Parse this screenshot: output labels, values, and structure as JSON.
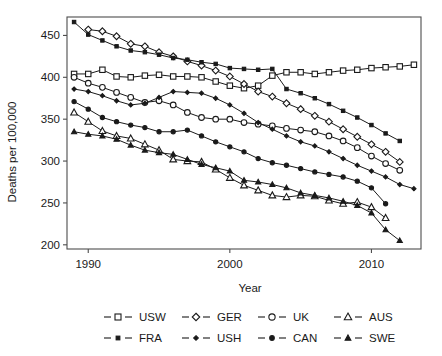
{
  "chart_data": {
    "type": "line",
    "title": "",
    "xlabel": "Year",
    "ylabel": "Deaths per 100,000",
    "xlim": [
      1988.5,
      2013.5
    ],
    "ylim": [
      195,
      472
    ],
    "xticks": [
      1990,
      2000,
      2010
    ],
    "yticks": [
      200,
      250,
      300,
      350,
      400,
      450
    ],
    "grid": false,
    "legend_position": "bottom",
    "legend_columns": 4,
    "series": [
      {
        "name": "USW",
        "label": "USW",
        "marker": "open-square",
        "color": "#1a1a1a",
        "fill": "#ffffff",
        "x": [
          1989,
          1990,
          1991,
          1992,
          1993,
          1994,
          1995,
          1996,
          1997,
          1998,
          1999,
          2000,
          2001,
          2002,
          2003,
          2004,
          2005,
          2006,
          2007,
          2008,
          2009,
          2010,
          2011,
          2012,
          2013
        ],
        "y": [
          404,
          404,
          409,
          401,
          400,
          402,
          403,
          401,
          401,
          400,
          395,
          390,
          387,
          390,
          402,
          406,
          406,
          404,
          406,
          408,
          409,
          411,
          412,
          413,
          415
        ]
      },
      {
        "name": "GER",
        "label": "GER",
        "marker": "open-diamond",
        "color": "#1a1a1a",
        "fill": "#ffffff",
        "x": [
          1990,
          1991,
          1992,
          1993,
          1994,
          1995,
          1996,
          1997,
          1998,
          1999,
          2000,
          2001,
          2002,
          2003,
          2004,
          2005,
          2006,
          2007,
          2008,
          2009,
          2010,
          2011,
          2012
        ],
        "y": [
          457,
          455,
          449,
          440,
          437,
          430,
          425,
          419,
          414,
          408,
          401,
          392,
          383,
          377,
          369,
          362,
          354,
          347,
          338,
          329,
          320,
          311,
          299
        ]
      },
      {
        "name": "UK",
        "label": "UK",
        "marker": "open-circle",
        "color": "#1a1a1a",
        "fill": "#ffffff",
        "x": [
          1989,
          1990,
          1991,
          1992,
          1993,
          1994,
          1995,
          1996,
          1997,
          1998,
          1999,
          2000,
          2001,
          2002,
          2003,
          2004,
          2005,
          2006,
          2007,
          2008,
          2009,
          2010,
          2011,
          2012
        ],
        "y": [
          400,
          393,
          388,
          382,
          376,
          370,
          372,
          367,
          358,
          352,
          350,
          350,
          346,
          344,
          342,
          339,
          337,
          335,
          330,
          324,
          316,
          306,
          297,
          289
        ]
      },
      {
        "name": "AUS",
        "label": "AUS",
        "marker": "open-triangle",
        "color": "#1a1a1a",
        "fill": "#ffffff",
        "x": [
          1989,
          1990,
          1991,
          1992,
          1993,
          1994,
          1995,
          1996,
          1997,
          1998,
          1999,
          2000,
          2001,
          2002,
          2003,
          2004,
          2005,
          2006,
          2007,
          2008,
          2009,
          2010,
          2011
        ],
        "y": [
          358,
          347,
          336,
          330,
          327,
          320,
          313,
          302,
          300,
          299,
          290,
          280,
          271,
          265,
          259,
          257,
          259,
          258,
          253,
          249,
          251,
          245,
          232
        ]
      },
      {
        "name": "FRA",
        "label": "FRA",
        "marker": "filled-square",
        "color": "#1a1a1a",
        "fill": "#1a1a1a",
        "x": [
          1989,
          1990,
          1991,
          1992,
          1993,
          1994,
          1995,
          1996,
          1997,
          1998,
          1999,
          2000,
          2001,
          2002,
          2003,
          2004,
          2005,
          2006,
          2007,
          2008,
          2009,
          2010,
          2011,
          2012
        ],
        "y": [
          466,
          451,
          444,
          437,
          432,
          430,
          427,
          423,
          421,
          418,
          416,
          411,
          410,
          409,
          410,
          386,
          381,
          375,
          368,
          360,
          352,
          343,
          333,
          324
        ]
      },
      {
        "name": "USH",
        "label": "USH",
        "marker": "filled-diamond",
        "color": "#1a1a1a",
        "fill": "#1a1a1a",
        "x": [
          1989,
          1990,
          1991,
          1992,
          1993,
          1994,
          1995,
          1996,
          1997,
          1998,
          1999,
          2000,
          2001,
          2002,
          2003,
          2004,
          2005,
          2006,
          2007,
          2008,
          2009,
          2010,
          2011,
          2012,
          2013
        ],
        "y": [
          386,
          383,
          378,
          372,
          367,
          369,
          376,
          383,
          382,
          381,
          375,
          367,
          357,
          346,
          338,
          330,
          323,
          318,
          311,
          303,
          295,
          288,
          281,
          272,
          267
        ]
      },
      {
        "name": "CAN",
        "label": "CAN",
        "marker": "filled-circle",
        "color": "#1a1a1a",
        "fill": "#1a1a1a",
        "x": [
          1989,
          1990,
          1991,
          1992,
          1993,
          1994,
          1995,
          1996,
          1997,
          1998,
          1999,
          2000,
          2001,
          2002,
          2003,
          2004,
          2005,
          2006,
          2007,
          2008,
          2009,
          2010,
          2011
        ],
        "y": [
          371,
          362,
          352,
          347,
          343,
          340,
          335,
          335,
          337,
          330,
          323,
          317,
          311,
          303,
          298,
          295,
          291,
          287,
          284,
          281,
          276,
          268,
          249
        ]
      },
      {
        "name": "SWE",
        "label": "SWE",
        "marker": "filled-triangle",
        "color": "#1a1a1a",
        "fill": "#1a1a1a",
        "x": [
          1989,
          1990,
          1991,
          1992,
          1993,
          1994,
          1995,
          1996,
          1997,
          1998,
          1999,
          2000,
          2001,
          2002,
          2003,
          2004,
          2005,
          2006,
          2007,
          2008,
          2009,
          2010,
          2011,
          2012
        ],
        "y": [
          335,
          332,
          330,
          326,
          319,
          313,
          310,
          308,
          302,
          296,
          292,
          288,
          277,
          275,
          272,
          268,
          262,
          259,
          256,
          252,
          247,
          238,
          218,
          205
        ]
      }
    ]
  },
  "axis": {
    "ylabel": "Deaths per 100,000",
    "xlabel": "Year",
    "ytick_labels": [
      "450",
      "400",
      "350",
      "300",
      "250",
      "200"
    ],
    "xtick_labels": [
      "1990",
      "2000",
      "2010"
    ]
  },
  "legend": {
    "row1": [
      "USW",
      "GER",
      "UK",
      "AUS"
    ],
    "row2": [
      "FRA",
      "USH",
      "CAN",
      "SWE"
    ]
  }
}
